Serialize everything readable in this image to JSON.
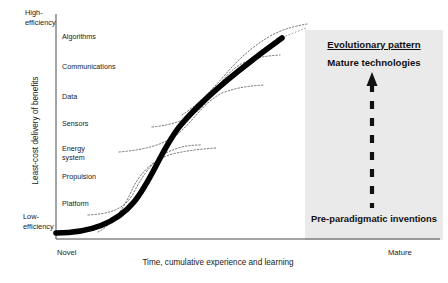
{
  "figure": {
    "title": "",
    "type": "s-curve-technology-diagram"
  },
  "axes": {
    "y_title": "Least-cost delivery of benefits",
    "y_top_label": "High-\nefficiency",
    "y_bottom_label": "Low-\nefficiency",
    "x_title": "Time, cumulative experience and learning",
    "x_left_label": "Novel",
    "x_right_label": "Mature"
  },
  "tech_labels": [
    {
      "text": "Algorithms",
      "x": 62,
      "y": 33
    },
    {
      "text": "Communications",
      "x": 62,
      "y": 63
    },
    {
      "text": "Data",
      "x": 62,
      "y": 93
    },
    {
      "text": "Sensors",
      "x": 62,
      "y": 120
    },
    {
      "text": "Energy\nsystem",
      "x": 62,
      "y": 145
    },
    {
      "text": "Propulsion",
      "x": 62,
      "y": 173
    },
    {
      "text": "Platform",
      "x": 62,
      "y": 200
    }
  ],
  "callout": {
    "title": "Evolutionary pattern",
    "subtitle": "Mature technologies",
    "footer": "Pre-paradigmatic inventions",
    "arrow_direction": "up",
    "arrow_style": "dashed"
  },
  "colors": {
    "background": "#ffffff",
    "ink": "#1a1a1a",
    "panel_fill": "#eaeaea",
    "main_curve": "#000000",
    "sub_curve": "#555555"
  },
  "chart_data": {
    "type": "line",
    "title": "",
    "xlabel": "Time, cumulative experience and learning",
    "ylabel": "Least-cost delivery of benefits",
    "xlim": [
      "Novel",
      "Mature"
    ],
    "ylim": [
      "Low-efficiency",
      "High-efficiency"
    ],
    "grid": false,
    "legend": "none",
    "series": [
      {
        "name": "Aggregate S-curve",
        "style": "thick-solid",
        "points": [
          [
            55,
            233
          ],
          [
            75,
            231
          ],
          [
            95,
            226
          ],
          [
            115,
            217
          ],
          [
            132,
            205
          ],
          [
            148,
            188
          ],
          [
            162,
            166
          ],
          [
            176,
            142
          ],
          [
            192,
            118
          ],
          [
            210,
            96
          ],
          [
            230,
            78
          ],
          [
            252,
            60
          ],
          [
            270,
            46
          ],
          [
            283,
            37
          ]
        ]
      },
      {
        "name": "Platform",
        "style": "dotted",
        "points": [
          [
            88,
            215
          ],
          [
            105,
            212
          ],
          [
            120,
            206
          ],
          [
            132,
            194
          ],
          [
            142,
            178
          ],
          [
            152,
            163
          ],
          [
            165,
            152
          ],
          [
            182,
            147
          ],
          [
            200,
            145
          ]
        ]
      },
      {
        "name": "Propulsion",
        "style": "dotted",
        "points": [
          [
            98,
            232
          ],
          [
            112,
            222
          ],
          [
            124,
            206
          ],
          [
            133,
            188
          ],
          [
            144,
            172
          ],
          [
            158,
            160
          ],
          [
            176,
            153
          ],
          [
            196,
            150
          ],
          [
            214,
            148
          ]
        ]
      },
      {
        "name": "Energy system",
        "style": "dotted",
        "points": [
          [
            119,
            152
          ],
          [
            140,
            149
          ],
          [
            160,
            144
          ],
          [
            178,
            134
          ],
          [
            194,
            118
          ],
          [
            208,
            102
          ],
          [
            224,
            92
          ],
          [
            244,
            87
          ],
          [
            262,
            85
          ]
        ]
      },
      {
        "name": "Sensors / Data",
        "style": "dotted",
        "points": [
          [
            152,
            127
          ],
          [
            172,
            124
          ],
          [
            190,
            118
          ],
          [
            204,
            106
          ],
          [
            216,
            90
          ],
          [
            228,
            74
          ],
          [
            242,
            63
          ],
          [
            260,
            57
          ],
          [
            278,
            55
          ]
        ]
      },
      {
        "name": "Communications / Algorithms",
        "style": "dotted",
        "points": [
          [
            182,
            115
          ],
          [
            200,
            104
          ],
          [
            216,
            88
          ],
          [
            232,
            70
          ],
          [
            250,
            54
          ],
          [
            268,
            41
          ],
          [
            288,
            32
          ],
          [
            305,
            27
          ]
        ]
      }
    ]
  }
}
